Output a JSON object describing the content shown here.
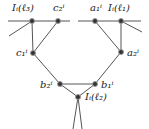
{
  "diagram": {
    "colors": {
      "line": "#555555",
      "node_fill": "#333333",
      "node_ring": "#888888",
      "text": "#222222"
    },
    "nodes": [
      {
        "id": "I3",
        "label": "Iᵢ(ℓ₃)",
        "x": 32,
        "y": 21
      },
      {
        "id": "c2",
        "label": "c₂ⁱ",
        "x": 58,
        "y": 21
      },
      {
        "id": "a1",
        "label": "a₁ⁱ",
        "x": 95,
        "y": 21
      },
      {
        "id": "I1",
        "label": "Iᵢ(ℓ₁)",
        "x": 121,
        "y": 21
      },
      {
        "id": "c1",
        "label": "c₁ⁱ",
        "x": 33,
        "y": 53
      },
      {
        "id": "a2",
        "label": "a₂ⁱ",
        "x": 121,
        "y": 52
      },
      {
        "id": "b2",
        "label": "b₂ⁱ",
        "x": 60,
        "y": 84
      },
      {
        "id": "b1",
        "label": "b₁ⁱ",
        "x": 95,
        "y": 84
      },
      {
        "id": "I2",
        "label": "Iᵢ(ℓ₂)",
        "x": 78,
        "y": 97
      }
    ],
    "edges": [
      [
        "I3",
        "c2"
      ],
      [
        "a1",
        "I1"
      ],
      [
        "I3",
        "c1"
      ],
      [
        "c2",
        "c1"
      ],
      [
        "I1",
        "a2"
      ],
      [
        "a1",
        "a2"
      ],
      [
        "c1",
        "b2"
      ],
      [
        "a2",
        "b1"
      ],
      [
        "b2",
        "b1"
      ],
      [
        "b2",
        "I2"
      ],
      [
        "b1",
        "I2"
      ]
    ]
  }
}
